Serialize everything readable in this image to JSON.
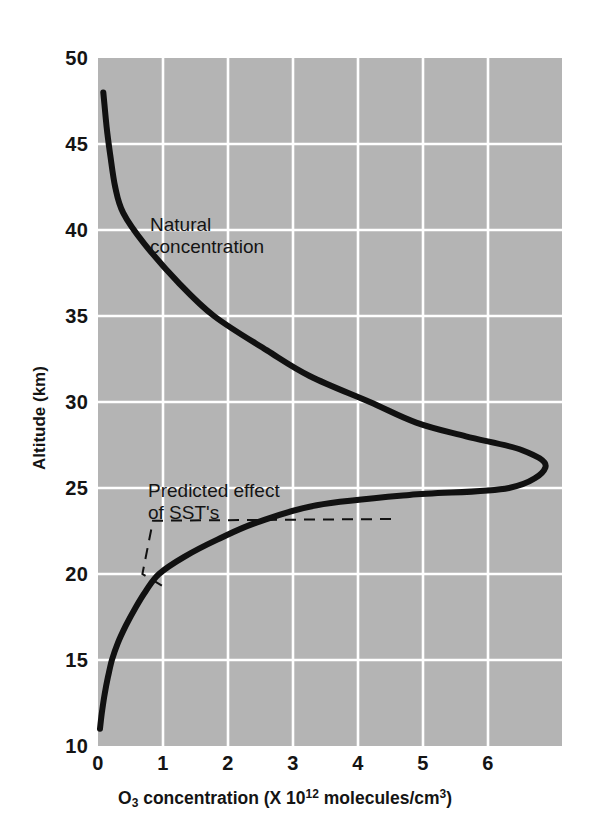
{
  "chart_data": {
    "type": "line",
    "title": "",
    "xlabel": "O3 concentration (X 10^12 molecules/cm3)",
    "xlabel_parts": {
      "pre_sub": "O",
      "sub1": "3",
      "mid": " concentration (X 10",
      "sup1": "12",
      "mid2": " molecules/cm",
      "sup2": "3",
      "post": ")"
    },
    "ylabel": "Altitude (km)",
    "xlim": [
      0,
      7.0
    ],
    "ylim": [
      10,
      50
    ],
    "xticks": [
      "0",
      "1",
      "2",
      "3",
      "4",
      "5",
      "6"
    ],
    "xtick_values": [
      0,
      1,
      2,
      3,
      4,
      5,
      6
    ],
    "yticks": [
      "10",
      "15",
      "20",
      "25",
      "30",
      "35",
      "40",
      "45",
      "50"
    ],
    "ytick_values": [
      10,
      15,
      20,
      25,
      30,
      35,
      40,
      45,
      50
    ],
    "grid": true,
    "grid_color": "#ffffff",
    "plot_background": "#b4b4b4",
    "legend_position": "none",
    "series": [
      {
        "name": "Natural concentration",
        "style": "solid",
        "color": "#111111",
        "linewidth": 6,
        "orientation": "x=concentration, y=altitude",
        "points": [
          {
            "conc": 0.03,
            "alt": 11.0
          },
          {
            "conc": 0.06,
            "alt": 12.0
          },
          {
            "conc": 0.1,
            "alt": 13.0
          },
          {
            "conc": 0.15,
            "alt": 14.0
          },
          {
            "conc": 0.21,
            "alt": 15.0
          },
          {
            "conc": 0.3,
            "alt": 16.0
          },
          {
            "conc": 0.42,
            "alt": 17.0
          },
          {
            "conc": 0.56,
            "alt": 18.0
          },
          {
            "conc": 0.72,
            "alt": 19.0
          },
          {
            "conc": 0.92,
            "alt": 20.0
          },
          {
            "conc": 1.3,
            "alt": 21.0
          },
          {
            "conc": 1.8,
            "alt": 22.0
          },
          {
            "conc": 2.4,
            "alt": 23.0
          },
          {
            "conc": 3.3,
            "alt": 24.0
          },
          {
            "conc": 4.7,
            "alt": 24.6
          },
          {
            "conc": 6.2,
            "alt": 25.0
          },
          {
            "conc": 6.75,
            "alt": 26.2
          },
          {
            "conc": 6.4,
            "alt": 27.2
          },
          {
            "conc": 5.55,
            "alt": 28.0
          },
          {
            "conc": 4.8,
            "alt": 28.8
          },
          {
            "conc": 4.1,
            "alt": 30.0
          },
          {
            "conc": 3.2,
            "alt": 31.5
          },
          {
            "conc": 2.55,
            "alt": 33.0
          },
          {
            "conc": 1.75,
            "alt": 35.0
          },
          {
            "conc": 1.2,
            "alt": 37.0
          },
          {
            "conc": 0.7,
            "alt": 39.2
          },
          {
            "conc": 0.38,
            "alt": 41.0
          },
          {
            "conc": 0.26,
            "alt": 42.5
          },
          {
            "conc": 0.18,
            "alt": 44.5
          },
          {
            "conc": 0.13,
            "alt": 46.0
          },
          {
            "conc": 0.08,
            "alt": 48.0
          }
        ]
      },
      {
        "name": "Predicted effect of SST's",
        "style": "dashed",
        "color": "#111111",
        "linewidth": 2,
        "role": "leader-line",
        "points": [
          {
            "conc": 4.42,
            "alt": 23.2
          },
          {
            "conc": 0.83,
            "alt": 23.1
          },
          {
            "conc": 0.67,
            "alt": 20.0
          },
          {
            "conc": 1.06,
            "alt": 19.1
          }
        ]
      }
    ],
    "annotations": [
      {
        "text": "Natural\nconcentration",
        "conc": 0.8,
        "alt": 40.6
      },
      {
        "text": "Predicted effect\nof SST's",
        "conc": 0.77,
        "alt": 25.6
      }
    ]
  },
  "axis": {
    "y_title": "Altitude (km)",
    "x_title_pre": "O",
    "x_title_sub": "3",
    "x_title_mid": " concentration (X 10",
    "x_title_sup": "12",
    "x_title_mid2": " molecules/cm",
    "x_title_sup2": "3",
    "x_title_end": ")"
  },
  "annotations": {
    "natural": "Natural\nconcentration",
    "sst": "Predicted effect\nof SST's"
  },
  "ticks": {
    "y": [
      "50",
      "45",
      "40",
      "35",
      "30",
      "25",
      "20",
      "15",
      "10"
    ],
    "x": [
      "0",
      "1",
      "2",
      "3",
      "4",
      "5",
      "6"
    ]
  }
}
